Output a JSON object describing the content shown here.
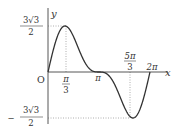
{
  "chart_data": {
    "type": "line",
    "title": "",
    "function": "y = 2 sin x + sin 2x",
    "xlabel": "x",
    "ylabel": "y",
    "origin_label": "O",
    "x_ticks": [
      {
        "value": 1.0472,
        "label_num": "π",
        "label_den": "3"
      },
      {
        "value": 3.1416,
        "label": "π"
      },
      {
        "value": 5.236,
        "label_num": "5π",
        "label_den": "3"
      },
      {
        "value": 6.2832,
        "label": "2π"
      }
    ],
    "y_ticks": [
      {
        "value": 2.598,
        "label_num": "3√3",
        "label_den": "2"
      },
      {
        "value": -2.598,
        "label_prefix": "−",
        "label_num": "3√3",
        "label_den": "2"
      }
    ],
    "x": [
      0,
      0.5236,
      1.0472,
      1.5708,
      2.0944,
      2.618,
      3.1416,
      3.6652,
      4.1888,
      4.7124,
      5.236,
      5.7596,
      6.2832
    ],
    "values": [
      0,
      1.866,
      2.598,
      2.0,
      0.866,
      0.134,
      0,
      -0.134,
      -0.866,
      -2.0,
      -2.598,
      -1.866,
      0
    ],
    "xlim": [
      0,
      6.2832
    ],
    "ylim": [
      -2.598,
      2.598
    ],
    "grid": false,
    "dotted_guides": true,
    "line_color": "#333333"
  },
  "labels": {
    "y_axis": "y",
    "x_axis": "x",
    "origin": "O",
    "max_num": "3√3",
    "max_den": "2",
    "min_prefix": "−",
    "min_num": "3√3",
    "min_den": "2",
    "pi3_num": "π",
    "pi3_den": "3",
    "pi": "π",
    "fivepi3_num": "5π",
    "fivepi3_den": "3",
    "twopi": "2π"
  }
}
